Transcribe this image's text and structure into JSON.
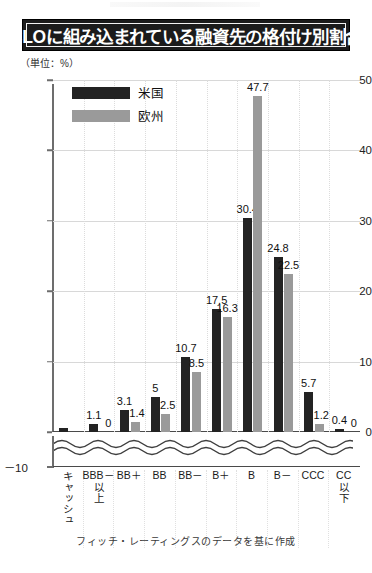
{
  "header": {
    "title": "CLOに組み込まれている融資先の格付け別割合",
    "unit_label": "（単位：%）"
  },
  "legend": {
    "items": [
      {
        "label": "米国",
        "color": "#232323",
        "key": "us"
      },
      {
        "label": "欧州",
        "color": "#9a9a9a",
        "key": "eu"
      }
    ]
  },
  "footer": {
    "source": "フィッチ・レーティングスのデータを基に作成"
  },
  "axis": {
    "y_ticks": [
      "50",
      "40",
      "30",
      "20",
      "10",
      "0"
    ],
    "negative_tick": "－10",
    "break_marker": "wavy-axis-break"
  },
  "chart_data": {
    "type": "bar",
    "title": "CLOに組み込まれている融資先の格付け別割合",
    "xlabel": "",
    "ylabel": "（単位：%）",
    "ylim": [
      -10,
      50
    ],
    "yticks": [
      0,
      10,
      20,
      30,
      40,
      50
    ],
    "axis_break": true,
    "grid": true,
    "legend_position": "top-left",
    "categories": [
      "キャッシュ",
      "BBB－以上",
      "BB＋",
      "BB",
      "BB－",
      "B＋",
      "B",
      "B－",
      "CCC",
      "CC以下"
    ],
    "category_display": [
      {
        "head": "",
        "tail": "キャッシュ"
      },
      {
        "head": "BBB－",
        "tail": "以上"
      },
      {
        "head": "BB＋",
        "tail": ""
      },
      {
        "head": "BB",
        "tail": ""
      },
      {
        "head": "BB－",
        "tail": ""
      },
      {
        "head": "B＋",
        "tail": ""
      },
      {
        "head": "B",
        "tail": ""
      },
      {
        "head": "B－",
        "tail": ""
      },
      {
        "head": "CCC",
        "tail": ""
      },
      {
        "head": "CC",
        "tail": "以下"
      }
    ],
    "series": [
      {
        "name": "米国",
        "color": "#232323",
        "values": [
          0.5,
          1.1,
          3.1,
          5,
          10.7,
          17.5,
          30.4,
          24.8,
          5.7,
          0.4
        ],
        "labels": [
          "",
          "1.1",
          "3.1",
          "5",
          "10.7",
          "17.5",
          "30.4",
          "24.8",
          "5.7",
          "0.4"
        ]
      },
      {
        "name": "欧州",
        "color": "#9a9a9a",
        "values": [
          -0.6,
          0,
          1.4,
          2.5,
          8.5,
          16.3,
          47.7,
          22.5,
          1.2,
          0
        ],
        "labels": [
          "",
          "0",
          "1.4",
          "2.5",
          "8.5",
          "16.3",
          "47.7",
          "22.5",
          "1.2",
          "0"
        ]
      }
    ]
  }
}
